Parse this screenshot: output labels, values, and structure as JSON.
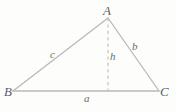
{
  "figure": {
    "kind": "geometry-diagram",
    "width": 176,
    "height": 111,
    "background_color": "#fdfdfc",
    "stroke_color": "#b9b9b9",
    "dash_color": "#c2c2c2",
    "label_color": "#6b6b6b"
  },
  "vertices": [
    {
      "id": "A",
      "label": "A",
      "x": 108,
      "y": 18
    },
    {
      "id": "B",
      "label": "B",
      "x": 13,
      "y": 91
    },
    {
      "id": "C",
      "label": "C",
      "x": 159,
      "y": 91
    }
  ],
  "sides": [
    {
      "id": "c",
      "label": "c",
      "from": "B",
      "to": "A"
    },
    {
      "id": "b",
      "label": "b",
      "from": "A",
      "to": "C"
    },
    {
      "id": "a",
      "label": "a",
      "from": "B",
      "to": "C"
    }
  ],
  "altitude": {
    "id": "h",
    "label": "h",
    "style": "dashed",
    "from": "A",
    "foot_x": 108,
    "foot_y": 91
  }
}
